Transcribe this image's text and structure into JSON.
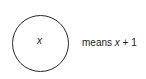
{
  "diagram": {
    "node_label": "x",
    "legend_prefix": "means ",
    "legend_var": "x",
    "legend_suffix": " + 1"
  }
}
